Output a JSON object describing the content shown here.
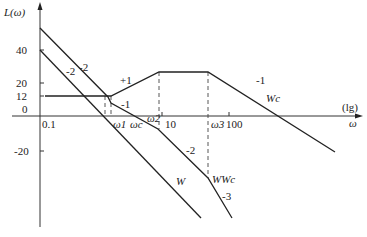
{
  "diagram": {
    "type": "bode-magnitude-asymptotic",
    "y_axis": {
      "label": "L(ω)",
      "ticks": [
        "40",
        "20",
        "12",
        "0",
        "-20"
      ]
    },
    "x_axis": {
      "label": "ω",
      "scale_note": "(lg)",
      "ticks": [
        "0.1",
        "10",
        "100"
      ]
    },
    "frequency_marks": [
      "ω1",
      "ωc",
      "ω2",
      "ω3"
    ],
    "curves": {
      "W": "W",
      "Wc": "Wc",
      "WWc": "WWc"
    },
    "slopes": {
      "w_upper": "-2",
      "w_lower": "-2",
      "wc_rise": "+1",
      "wc_fall": "-1",
      "wwc_mid": "-1",
      "wwc_lower": "-2",
      "wwc_end": "-3"
    }
  }
}
